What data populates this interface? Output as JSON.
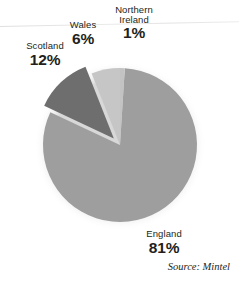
{
  "chart_data": {
    "type": "pie",
    "title": "",
    "subtitle": "",
    "xlabel": "",
    "ylabel": "",
    "legend_position": "none",
    "grid": false,
    "unit": "%",
    "source_note": "Source: Mintel",
    "categories": [
      "Northern Ireland",
      "England",
      "Scotland",
      "Wales"
    ],
    "values": [
      1,
      81,
      12,
      6
    ],
    "slices": [
      {
        "name": "Northern Ireland",
        "label_name": "Northern\nIreland",
        "label_line1": "Northern",
        "label_line2": "Ireland",
        "value": 1,
        "value_label": "1%",
        "color": "#c3c3c3",
        "start_angle": 0,
        "end_angle": 3.6,
        "exploded": false
      },
      {
        "name": "England",
        "label_name": "England",
        "value": 81,
        "value_label": "81%",
        "color": "#9e9e9e",
        "start_angle": 3.6,
        "end_angle": 295.2,
        "exploded": false
      },
      {
        "name": "Scotland",
        "label_name": "Scotland",
        "value": 12,
        "value_label": "12%",
        "color": "#6e6e6e",
        "start_angle": 295.2,
        "end_angle": 338.4,
        "exploded": true
      },
      {
        "name": "Wales",
        "label_name": "Wales",
        "value": 6,
        "value_label": "6%",
        "color": "#c6c6c6",
        "start_angle": 338.4,
        "end_angle": 360,
        "exploded": false
      }
    ],
    "geometry": {
      "center_x": 120,
      "center_y": 145,
      "radius": 77,
      "explode_offset": 9
    },
    "colors": {
      "england": "#9e9e9e",
      "scotland": "#6e6e6e",
      "wales": "#c6c6c6",
      "northern_ireland": "#c3c3c3",
      "text": "#231f20",
      "background": "#ffffff"
    }
  },
  "source": {
    "text": "Source: Mintel"
  }
}
